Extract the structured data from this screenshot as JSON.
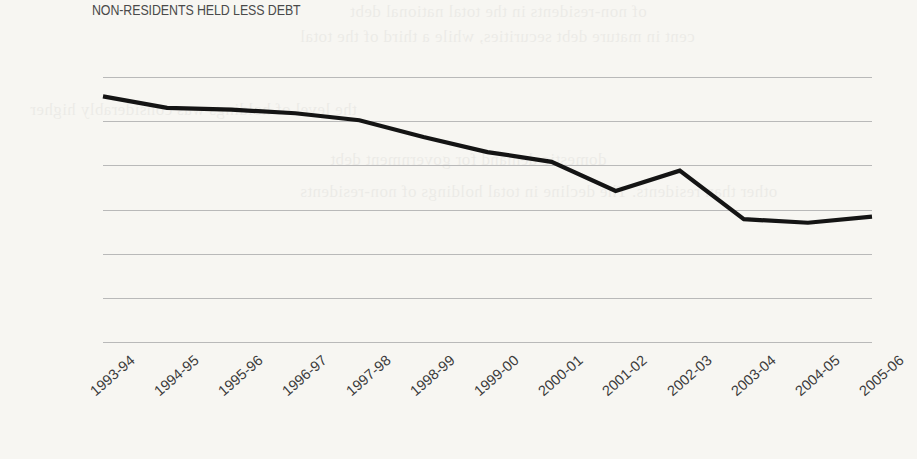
{
  "chart_data": {
    "type": "line",
    "title": "NON-RESIDENTS HELD LESS DEBT",
    "xlabel": "",
    "ylabel": "",
    "categories": [
      "1993-94",
      "1994-95",
      "1995-96",
      "1996-97",
      "1997-98",
      "1998-99",
      "1999-00",
      "2000-01",
      "2001-02",
      "2002-03",
      "2003-04",
      "2004-05",
      "2005-06"
    ],
    "values": [
      27.8,
      26.5,
      26.3,
      25.9,
      25.1,
      23.2,
      21.5,
      20.4,
      17.1,
      19.4,
      13.9,
      13.5,
      14.2
    ],
    "series": [
      {
        "name": "Non-resident holdings",
        "values": [
          27.8,
          26.5,
          26.3,
          25.9,
          25.1,
          23.2,
          21.5,
          20.4,
          17.1,
          19.4,
          13.9,
          13.5,
          14.2
        ]
      }
    ],
    "ylim": [
      0.0,
      30.0
    ],
    "y_ticks": [
      30.0,
      25.0,
      20.0,
      15.0,
      10.0,
      5.0,
      0.0
    ],
    "y_tick_labels": [
      "30.0",
      "25.0",
      "20.0",
      "15.0",
      "10.0",
      "5.0",
      "0.0"
    ],
    "grid": true,
    "legend": false,
    "legend_position": "none",
    "line_color": "#141414",
    "gridline_color": "#b9b9b9",
    "background_color": "#f7f6f2"
  },
  "ghost_text": {
    "lines": [
      "of non-residents in the total national debt",
      "cent in mature debt securities, while a third of the total",
      "the level of holdings was considerably higher",
      "domestic demand for government debt",
      "other than residents. The decline in total holdings of non-residents"
    ]
  }
}
